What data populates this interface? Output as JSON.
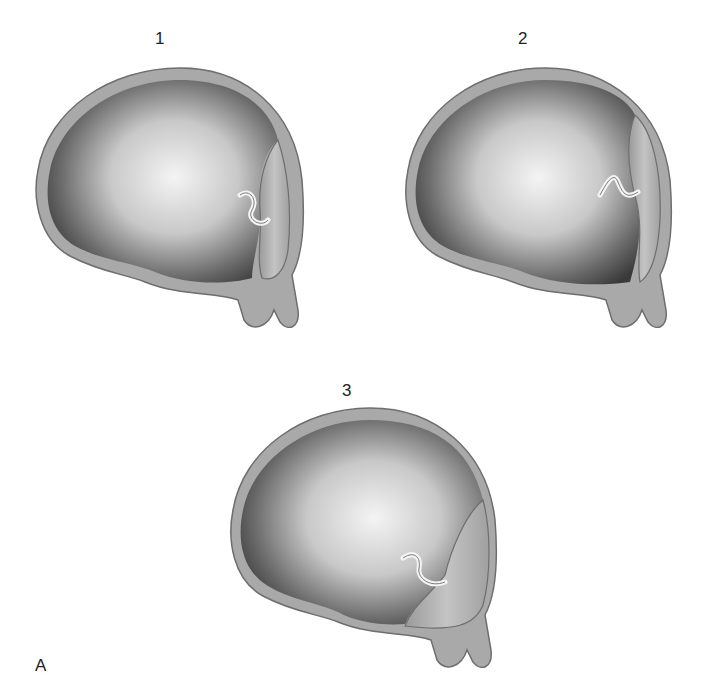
{
  "figure": {
    "panel_letter": "A",
    "panels": [
      {
        "number": "1",
        "description": "Sac with posterior wall projection and small lumen extension (stage 1)"
      },
      {
        "number": "2",
        "description": "Sac with posterior wall projection, lumen extending higher (stage 2)"
      },
      {
        "number": "3",
        "description": "Sac with posterior wall projection at lower pole (stage 3)"
      }
    ]
  },
  "colors": {
    "wall": "#a9a9a9",
    "wall_edge": "#6e6e6e",
    "cavity_dark": "#3a3a3a",
    "cavity_light": "#f2f2f2",
    "tissue": "#b5b5b5",
    "background": "#ffffff"
  }
}
